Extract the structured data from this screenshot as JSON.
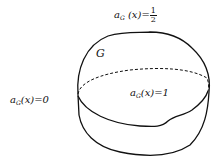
{
  "diagram": {
    "region_label": "ɢ",
    "region_symbol": "G",
    "labels": {
      "top": {
        "a": "a",
        "sub": "G",
        "x": "(x)=",
        "num": "1",
        "den": "2"
      },
      "left": {
        "a": "a",
        "sub": "G",
        "x": "(x)=0"
      },
      "inside": {
        "a": "a",
        "sub": "G",
        "x": "(x)=1"
      }
    },
    "stroke_color": "#111111",
    "background": "#ffffff"
  }
}
